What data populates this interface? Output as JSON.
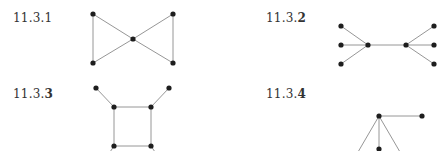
{
  "figures": [
    {
      "id": "11.3.1",
      "label_prefix": "11.3.",
      "label_suffix": "1",
      "label_pos": [
        13,
        12
      ],
      "nodes": [
        [
          93,
          14
        ],
        [
          173,
          14
        ],
        [
          133,
          39
        ],
        [
          93,
          63
        ],
        [
          173,
          63
        ]
      ],
      "edges": [
        [
          0,
          2
        ],
        [
          1,
          2
        ],
        [
          3,
          2
        ],
        [
          4,
          2
        ],
        [
          0,
          3
        ],
        [
          1,
          4
        ]
      ]
    },
    {
      "id": "11.3.2",
      "label_prefix": "11.3.",
      "label_suffix": "2",
      "label_pos": [
        266,
        12
      ],
      "nodes": [
        [
          341,
          26
        ],
        [
          341,
          45
        ],
        [
          341,
          64
        ],
        [
          368,
          45
        ],
        [
          406,
          45
        ],
        [
          434,
          26
        ],
        [
          434,
          45
        ],
        [
          434,
          64
        ]
      ],
      "edges": [
        [
          0,
          3
        ],
        [
          1,
          3
        ],
        [
          2,
          3
        ],
        [
          3,
          4
        ],
        [
          4,
          5
        ],
        [
          4,
          6
        ],
        [
          4,
          7
        ]
      ]
    },
    {
      "id": "11.3.3",
      "label_prefix": "11.3.",
      "label_suffix": "3",
      "label_pos": [
        13,
        88
      ],
      "nodes": [
        [
          96,
          88
        ],
        [
          169,
          88
        ],
        [
          114,
          107
        ],
        [
          151,
          107
        ],
        [
          114,
          146
        ],
        [
          151,
          146
        ]
      ],
      "edges": [
        [
          0,
          2
        ],
        [
          1,
          3
        ],
        [
          2,
          3
        ],
        [
          2,
          4
        ],
        [
          3,
          5
        ],
        [
          4,
          5
        ]
      ],
      "cut_edges": [
        [
          114,
          146,
          110,
          152
        ],
        [
          151,
          146,
          155,
          152
        ]
      ]
    },
    {
      "id": "11.3.4",
      "label_prefix": "11.3.",
      "label_suffix": "4",
      "label_pos": [
        266,
        88
      ],
      "nodes": [
        [
          379,
          116
        ],
        [
          422,
          116
        ],
        [
          379,
          149
        ]
      ],
      "edges": [
        [
          0,
          1
        ],
        [
          0,
          2
        ]
      ],
      "cut_edges": [
        [
          379,
          116,
          358,
          152
        ],
        [
          379,
          116,
          400,
          152
        ]
      ]
    }
  ]
}
